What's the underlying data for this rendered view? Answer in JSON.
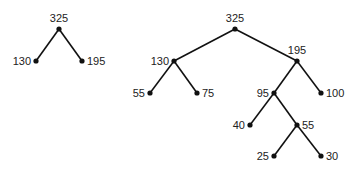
{
  "colors": {
    "line": "#111111",
    "node": "#111111",
    "text": "#222222",
    "background": "#ffffff"
  },
  "trees": [
    {
      "name": "small-tree",
      "nodes": [
        {
          "id": "a",
          "label": "325",
          "x": 59,
          "y": 29,
          "lx": 59,
          "ly": 22,
          "anchor": "middle"
        },
        {
          "id": "b",
          "label": "130",
          "x": 36,
          "y": 61,
          "lx": 31,
          "ly": 65,
          "anchor": "end"
        },
        {
          "id": "c",
          "label": "195",
          "x": 82,
          "y": 61,
          "lx": 87,
          "ly": 65,
          "anchor": "start"
        }
      ],
      "edges": [
        [
          "a",
          "b"
        ],
        [
          "a",
          "c"
        ]
      ]
    },
    {
      "name": "large-tree",
      "nodes": [
        {
          "id": "r",
          "label": "325",
          "x": 235,
          "y": 29,
          "lx": 235,
          "ly": 22,
          "anchor": "middle"
        },
        {
          "id": "l1",
          "label": "130",
          "x": 174,
          "y": 61,
          "lx": 169,
          "ly": 65,
          "anchor": "end"
        },
        {
          "id": "r1",
          "label": "195",
          "x": 297,
          "y": 61,
          "lx": 297,
          "ly": 54,
          "anchor": "middle"
        },
        {
          "id": "l2",
          "label": "55",
          "x": 150,
          "y": 93,
          "lx": 145,
          "ly": 97,
          "anchor": "end"
        },
        {
          "id": "l3",
          "label": "75",
          "x": 197,
          "y": 93,
          "lx": 202,
          "ly": 97,
          "anchor": "start"
        },
        {
          "id": "r2",
          "label": "95",
          "x": 274,
          "y": 93,
          "lx": 269,
          "ly": 97,
          "anchor": "end"
        },
        {
          "id": "r3",
          "label": "100",
          "x": 321,
          "y": 93,
          "lx": 326,
          "ly": 97,
          "anchor": "start"
        },
        {
          "id": "r4",
          "label": "40",
          "x": 250,
          "y": 125,
          "lx": 245,
          "ly": 129,
          "anchor": "end"
        },
        {
          "id": "r5",
          "label": "55",
          "x": 297,
          "y": 125,
          "lx": 302,
          "ly": 129,
          "anchor": "start"
        },
        {
          "id": "r6",
          "label": "25",
          "x": 274,
          "y": 156,
          "lx": 269,
          "ly": 160,
          "anchor": "end"
        },
        {
          "id": "r7",
          "label": "30",
          "x": 321,
          "y": 156,
          "lx": 326,
          "ly": 160,
          "anchor": "start"
        }
      ],
      "edges": [
        [
          "r",
          "l1"
        ],
        [
          "r",
          "r1"
        ],
        [
          "l1",
          "l2"
        ],
        [
          "l1",
          "l3"
        ],
        [
          "r1",
          "r2"
        ],
        [
          "r1",
          "r3"
        ],
        [
          "r2",
          "r4"
        ],
        [
          "r2",
          "r5"
        ],
        [
          "r5",
          "r6"
        ],
        [
          "r5",
          "r7"
        ]
      ]
    }
  ]
}
